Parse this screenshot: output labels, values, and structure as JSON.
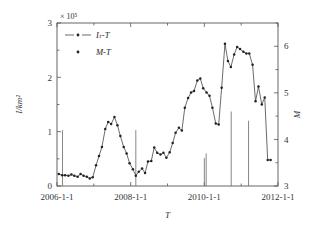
{
  "chart_data": {
    "type": "line",
    "title": "",
    "subtitle": "",
    "xlabel": "T",
    "ylabel": "I/km2",
    "ylabel_display": "I/km²",
    "y2label": "M",
    "y_exponent_text": "× 10⁵",
    "xlim": [
      "2006-1-1",
      "2012-1-1"
    ],
    "xlim_numeric": [
      2006.0,
      2012.0
    ],
    "ylim": [
      0,
      300000
    ],
    "ylim_scaled": [
      0,
      3
    ],
    "y2lim": [
      3,
      6.5
    ],
    "grid": false,
    "legend_position": "top-left",
    "xticks": [
      "2006-1-1",
      "2008-1-1",
      "2010-1-1",
      "2012-1-1"
    ],
    "xticks_numeric": [
      2006.0,
      2008.0,
      2010.0,
      2012.0
    ],
    "yticks": [
      "0",
      "1",
      "2",
      "3"
    ],
    "yticks_numeric": [
      0,
      1,
      2,
      3
    ],
    "y2ticks": [
      "3",
      "4",
      "5",
      "6"
    ],
    "y2ticks_numeric": [
      3,
      4,
      5,
      6
    ],
    "series": [
      {
        "name": "I_t-T",
        "legend_label": "Iₜ-T",
        "marker": "dot",
        "line": true,
        "axis": "left",
        "units": "×10⁵ /km²",
        "x": [
          2006.05,
          2006.14,
          2006.22,
          2006.31,
          2006.39,
          2006.47,
          2006.56,
          2006.64,
          2006.72,
          2006.81,
          2006.89,
          2006.97,
          2007.06,
          2007.14,
          2007.22,
          2007.31,
          2007.39,
          2007.47,
          2007.56,
          2007.64,
          2007.72,
          2007.81,
          2007.89,
          2007.97,
          2008.06,
          2008.14,
          2008.22,
          2008.31,
          2008.39,
          2008.47,
          2008.56,
          2008.64,
          2008.72,
          2008.81,
          2008.89,
          2008.97,
          2009.06,
          2009.14,
          2009.22,
          2009.31,
          2009.39,
          2009.47,
          2009.56,
          2009.64,
          2009.72,
          2009.81,
          2009.89,
          2009.97,
          2010.06,
          2010.14,
          2010.22,
          2010.31,
          2010.39,
          2010.47,
          2010.56,
          2010.64,
          2010.72,
          2010.81,
          2010.89,
          2010.97,
          2011.06,
          2011.14,
          2011.22,
          2011.31,
          2011.39,
          2011.47,
          2011.56,
          2011.64
        ],
        "values": [
          0.22,
          0.2,
          0.2,
          0.19,
          0.21,
          0.19,
          0.17,
          0.22,
          0.19,
          0.17,
          0.14,
          0.16,
          0.38,
          0.55,
          0.72,
          1.05,
          1.18,
          1.14,
          1.27,
          1.12,
          0.92,
          0.72,
          0.6,
          0.42,
          0.31,
          0.19,
          0.26,
          0.32,
          0.24,
          0.45,
          0.46,
          0.71,
          0.61,
          0.58,
          0.61,
          0.52,
          0.62,
          0.79,
          0.98,
          1.07,
          1.02,
          1.44,
          1.62,
          1.72,
          1.75,
          1.94,
          1.98,
          1.8,
          1.72,
          1.66,
          1.44,
          1.15,
          1.13,
          1.81,
          2.62,
          2.3,
          2.19,
          2.42,
          2.56,
          2.52,
          2.47,
          2.44,
          2.44,
          2.23,
          1.56,
          1.83,
          1.5,
          1.63
        ]
      },
      {
        "name": "M-T",
        "legend_label": "M-T",
        "marker": "dot",
        "line": false,
        "stem": true,
        "axis": "right",
        "x": [
          2006.15,
          2008.14,
          2010.0,
          2010.05,
          2010.73,
          2011.2
        ],
        "values": [
          4.2,
          4.2,
          3.6,
          3.7,
          4.6,
          4.4
        ]
      }
    ],
    "tail_points": {
      "x": [
        2011.72,
        2011.8
      ],
      "values": [
        0.48,
        0.48
      ]
    },
    "legend_entries": [
      {
        "label": "Iₜ-T",
        "style": "line-dot-line"
      },
      {
        "label": "M-T",
        "style": "dot"
      }
    ],
    "colors": {
      "series_line": "#3a3a3a",
      "marker": "#222222",
      "stem": "#6a6a6a",
      "axis": "#555555",
      "background": "#ffffff"
    }
  }
}
